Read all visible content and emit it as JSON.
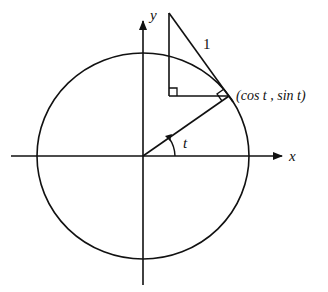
{
  "diagram": {
    "labels": {
      "x_axis": "x",
      "y_axis": "y",
      "angle": "t",
      "hypotenuse": "1",
      "point": "(cos t , sin t)"
    },
    "colors": {
      "stroke": "#111111",
      "background": "#ffffff"
    }
  }
}
